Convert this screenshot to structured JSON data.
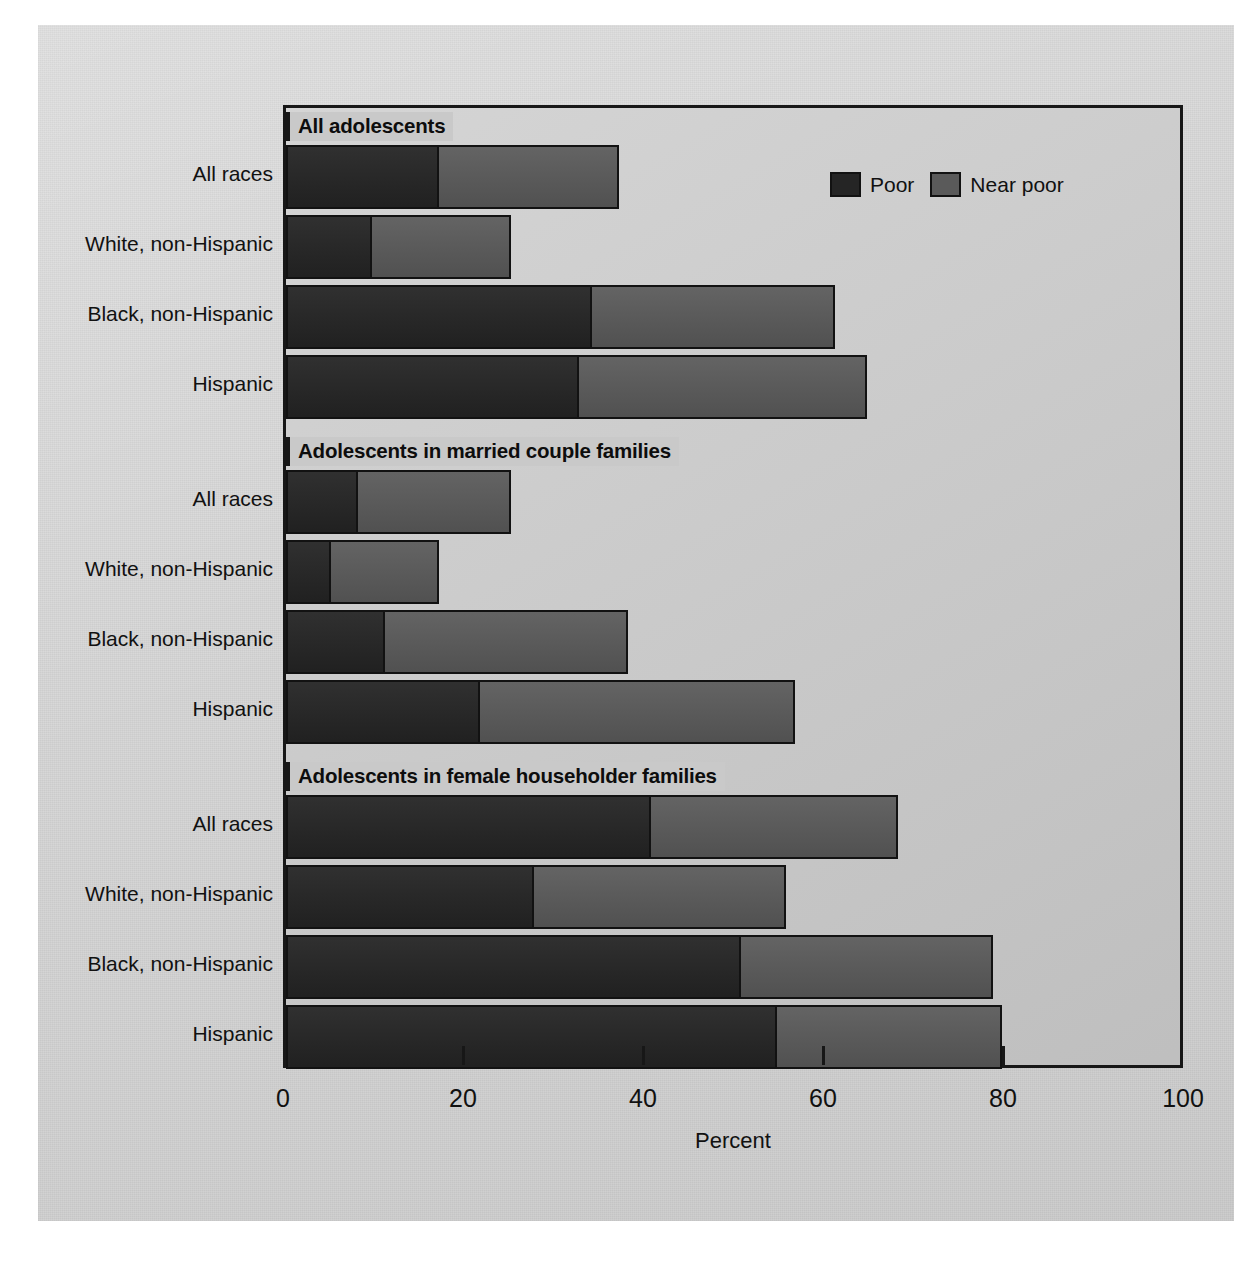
{
  "chart_data": {
    "type": "bar",
    "orientation": "horizontal",
    "stacked": true,
    "title": "",
    "xlabel": "Percent",
    "ylabel": "",
    "xlim": [
      0,
      100
    ],
    "xticks": [
      0,
      20,
      40,
      60,
      80,
      100
    ],
    "xtick_labels": [
      "0",
      "20",
      "40",
      "60",
      "80",
      "100"
    ],
    "grid": false,
    "legend": {
      "position": "top-right-inside",
      "entries": [
        {
          "name": "Poor",
          "color": "#252525"
        },
        {
          "name": "Near poor",
          "color": "#5a5a5a"
        }
      ]
    },
    "series": [
      {
        "name": "Poor",
        "color": "#252525"
      },
      {
        "name": "Near poor",
        "color": "#5a5a5a"
      }
    ],
    "groups": [
      {
        "header": "All adolescents",
        "categories": [
          "All races",
          "White, non-Hispanic",
          "Black, non-Hispanic",
          "Hispanic"
        ],
        "poor": [
          17.0,
          9.5,
          34.0,
          32.5
        ],
        "near_poor": [
          20.0,
          15.5,
          27.0,
          32.0
        ],
        "total": [
          37.0,
          25.0,
          61.0,
          64.5
        ]
      },
      {
        "header": "Adolescents in married couple families",
        "categories": [
          "All races",
          "White, non-Hispanic",
          "Black, non-Hispanic",
          "Hispanic"
        ],
        "poor": [
          8.0,
          5.0,
          11.0,
          21.5
        ],
        "near_poor": [
          17.0,
          12.0,
          27.0,
          35.0
        ],
        "total": [
          25.0,
          17.0,
          38.0,
          56.5
        ]
      },
      {
        "header": "Adolescents in female householder families",
        "categories": [
          "All races",
          "White, non-Hispanic",
          "Black, non-Hispanic",
          "Hispanic"
        ],
        "poor": [
          40.5,
          27.5,
          50.5,
          54.5
        ],
        "near_poor": [
          27.5,
          28.0,
          28.0,
          25.0
        ],
        "total": [
          68.0,
          55.5,
          78.5,
          79.5
        ]
      }
    ]
  }
}
